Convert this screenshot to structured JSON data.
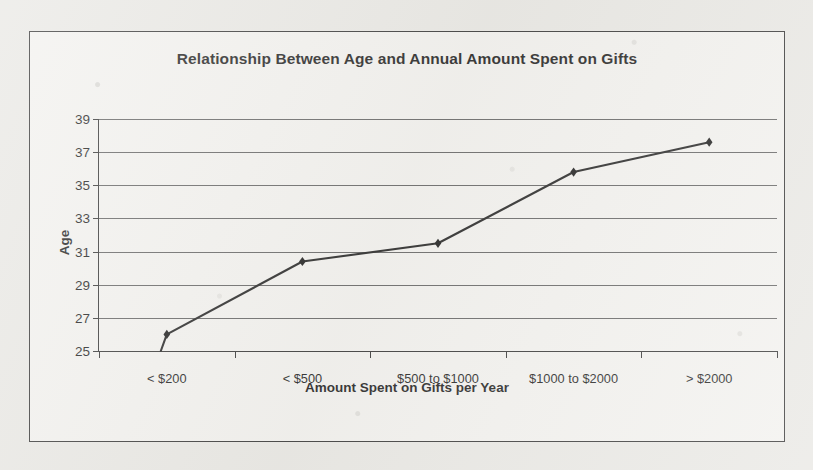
{
  "chart_data": {
    "type": "line",
    "title": "Relationship Between Age and Annual Amount Spent on Gifts",
    "xlabel": "Amount Spent on Gifts per Year",
    "ylabel": "Age",
    "categories": [
      "< $200",
      "< $500",
      "$500 to $1000",
      "$1000 to $2000",
      "> $2000"
    ],
    "values": [
      26.0,
      30.4,
      31.5,
      35.8,
      37.6
    ],
    "series": [
      {
        "name": "Age",
        "values": [
          26.0,
          30.4,
          31.5,
          35.8,
          37.6
        ]
      }
    ],
    "ylim": [
      25,
      39
    ],
    "ytick_labels": [
      "39",
      "37",
      "35",
      "33",
      "31",
      "29",
      "27",
      "25"
    ],
    "ytick_values": [
      39,
      37,
      35,
      33,
      31,
      29,
      27,
      25
    ],
    "grid": true,
    "legend": "none",
    "marker": "diamond",
    "line_color": "#1a1a1a",
    "marker_color": "#111111",
    "gridline_color": "#5d5d5d",
    "plot_background": "#f2f1ee"
  },
  "figure": {
    "border_color": "#2c2c2c",
    "page_background": "#e8e7e3"
  }
}
